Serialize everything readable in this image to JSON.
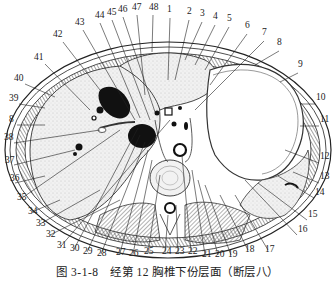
{
  "figure": {
    "caption": "图 3-1-8　经第 12 胸椎下份层面（断层八）",
    "figure_number": "3-1-8",
    "title": "经第 12 胸椎下份层面（断层八）"
  },
  "labels": [
    {
      "n": "1",
      "x": 167,
      "y": 12
    },
    {
      "n": "2",
      "x": 187,
      "y": 14
    },
    {
      "n": "3",
      "x": 200,
      "y": 16
    },
    {
      "n": "4",
      "x": 213,
      "y": 19
    },
    {
      "n": "5",
      "x": 227,
      "y": 21
    },
    {
      "n": "6",
      "x": 245,
      "y": 28
    },
    {
      "n": "7",
      "x": 262,
      "y": 35
    },
    {
      "n": "8",
      "x": 277,
      "y": 45
    },
    {
      "n": "9",
      "x": 298,
      "y": 67
    },
    {
      "n": "10",
      "x": 316,
      "y": 100
    },
    {
      "n": "11",
      "x": 320,
      "y": 122
    },
    {
      "n": "12",
      "x": 320,
      "y": 159
    },
    {
      "n": "13",
      "x": 320,
      "y": 179
    },
    {
      "n": "14",
      "x": 315,
      "y": 195
    },
    {
      "n": "15",
      "x": 308,
      "y": 217
    },
    {
      "n": "16",
      "x": 298,
      "y": 232
    },
    {
      "n": "17",
      "x": 265,
      "y": 252
    },
    {
      "n": "18",
      "x": 245,
      "y": 252
    },
    {
      "n": "19",
      "x": 228,
      "y": 257
    },
    {
      "n": "20",
      "x": 215,
      "y": 257
    },
    {
      "n": "21",
      "x": 202,
      "y": 257
    },
    {
      "n": "22",
      "x": 188,
      "y": 254
    },
    {
      "n": "23",
      "x": 175,
      "y": 254
    },
    {
      "n": "24",
      "x": 162,
      "y": 254
    },
    {
      "n": "25",
      "x": 144,
      "y": 254
    },
    {
      "n": "26",
      "x": 129,
      "y": 256
    },
    {
      "n": "27",
      "x": 116,
      "y": 255
    },
    {
      "n": "28",
      "x": 97,
      "y": 256
    },
    {
      "n": "29",
      "x": 83,
      "y": 254
    },
    {
      "n": "30",
      "x": 70,
      "y": 251
    },
    {
      "n": "31",
      "x": 57,
      "y": 248
    },
    {
      "n": "32",
      "x": 46,
      "y": 237
    },
    {
      "n": "33",
      "x": 36,
      "y": 226
    },
    {
      "n": "34",
      "x": 28,
      "y": 214
    },
    {
      "n": "35",
      "x": 17,
      "y": 200
    },
    {
      "n": "36",
      "x": 10,
      "y": 181
    },
    {
      "n": "37",
      "x": 5,
      "y": 163
    },
    {
      "n": "38",
      "x": 4,
      "y": 140
    },
    {
      "n": "8",
      "x": 9,
      "y": 122
    },
    {
      "n": "39",
      "x": 9,
      "y": 101
    },
    {
      "n": "40",
      "x": 14,
      "y": 81
    },
    {
      "n": "41",
      "x": 34,
      "y": 60
    },
    {
      "n": "42",
      "x": 53,
      "y": 37
    },
    {
      "n": "43",
      "x": 75,
      "y": 25
    },
    {
      "n": "44",
      "x": 95,
      "y": 18
    },
    {
      "n": "45",
      "x": 107,
      "y": 15
    },
    {
      "n": "46",
      "x": 118,
      "y": 12
    },
    {
      "n": "47",
      "x": 132,
      "y": 10
    },
    {
      "n": "48",
      "x": 149,
      "y": 10
    }
  ],
  "colors": {
    "ink": "#222222",
    "tissue_light": "#eeeeee",
    "tissue_stipple": "#d9d9d9",
    "muscle_hatch": "#888888",
    "vessel_dark": "#111111",
    "background": "#ffffff"
  }
}
